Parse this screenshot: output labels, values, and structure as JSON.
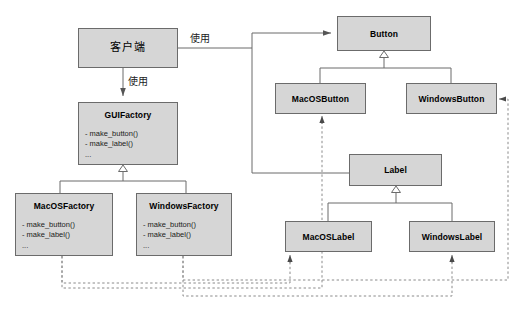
{
  "diagram": {
    "type": "uml-class-diagram",
    "width": 523,
    "height": 315,
    "background_color": "#ffffff",
    "box_fill_color": "#d6d6d6",
    "box_border_color": "#6b6b6b",
    "line_color": "#6b6b6b",
    "text_color": "#000000"
  },
  "classes": [
    {
      "id": "client",
      "name": "客户端",
      "language": "zh",
      "members": [],
      "x": 78,
      "y": 28,
      "w": 100,
      "h": 40
    },
    {
      "id": "guifactory",
      "name": "GUIFactory",
      "members": [
        "- make_button()",
        "- make_label()",
        "..."
      ],
      "x": 78,
      "y": 102,
      "w": 100,
      "h": 63
    },
    {
      "id": "macosfactory",
      "name": "MacOSFactory",
      "members": [
        "- make_button()",
        "- make_label()",
        "..."
      ],
      "x": 15,
      "y": 193,
      "w": 98,
      "h": 63
    },
    {
      "id": "windowsfactory",
      "name": "WindowsFactory",
      "members": [
        "- make_button()",
        "- make_label()",
        "..."
      ],
      "x": 136,
      "y": 193,
      "w": 96,
      "h": 63
    },
    {
      "id": "button",
      "name": "Button",
      "members": [],
      "x": 337,
      "y": 16,
      "w": 94,
      "h": 35
    },
    {
      "id": "macosbutton",
      "name": "MacOSButton",
      "members": [],
      "x": 275,
      "y": 83,
      "w": 91,
      "h": 31
    },
    {
      "id": "windowsbutton",
      "name": "WindowsButton",
      "members": [],
      "x": 406,
      "y": 83,
      "w": 91,
      "h": 31
    },
    {
      "id": "label",
      "name": "Label",
      "members": [],
      "x": 349,
      "y": 154,
      "w": 93,
      "h": 32
    },
    {
      "id": "macoslabel",
      "name": "MacOSLabel",
      "members": [],
      "x": 285,
      "y": 221,
      "w": 87,
      "h": 31
    },
    {
      "id": "windowslabel",
      "name": "WindowsLabel",
      "members": [],
      "x": 409,
      "y": 221,
      "w": 86,
      "h": 31
    }
  ],
  "edge_labels": [
    {
      "id": "uses-products",
      "text": "使用",
      "x": 190,
      "y": 30
    },
    {
      "id": "uses-factory",
      "text": "使用",
      "x": 128,
      "y": 77
    }
  ],
  "relations": [
    {
      "from": "client",
      "to": "button",
      "kind": "dependency-solid-arrow",
      "label": "使用"
    },
    {
      "from": "client",
      "to": "label",
      "kind": "dependency-solid-arrow",
      "label": "使用"
    },
    {
      "from": "client",
      "to": "guifactory",
      "kind": "dependency-solid-arrow",
      "label": "使用"
    },
    {
      "from": "macosfactory",
      "to": "guifactory",
      "kind": "generalization"
    },
    {
      "from": "windowsfactory",
      "to": "guifactory",
      "kind": "generalization"
    },
    {
      "from": "macosbutton",
      "to": "button",
      "kind": "generalization"
    },
    {
      "from": "windowsbutton",
      "to": "button",
      "kind": "generalization"
    },
    {
      "from": "macoslabel",
      "to": "label",
      "kind": "generalization"
    },
    {
      "from": "windowslabel",
      "to": "label",
      "kind": "generalization"
    },
    {
      "from": "macosfactory",
      "to": "macosbutton",
      "kind": "creates-dashed-arrow"
    },
    {
      "from": "macosfactory",
      "to": "macoslabel",
      "kind": "creates-dashed-arrow"
    },
    {
      "from": "windowsfactory",
      "to": "windowsbutton",
      "kind": "creates-dashed-arrow"
    },
    {
      "from": "windowsfactory",
      "to": "windowslabel",
      "kind": "creates-dashed-arrow"
    }
  ]
}
